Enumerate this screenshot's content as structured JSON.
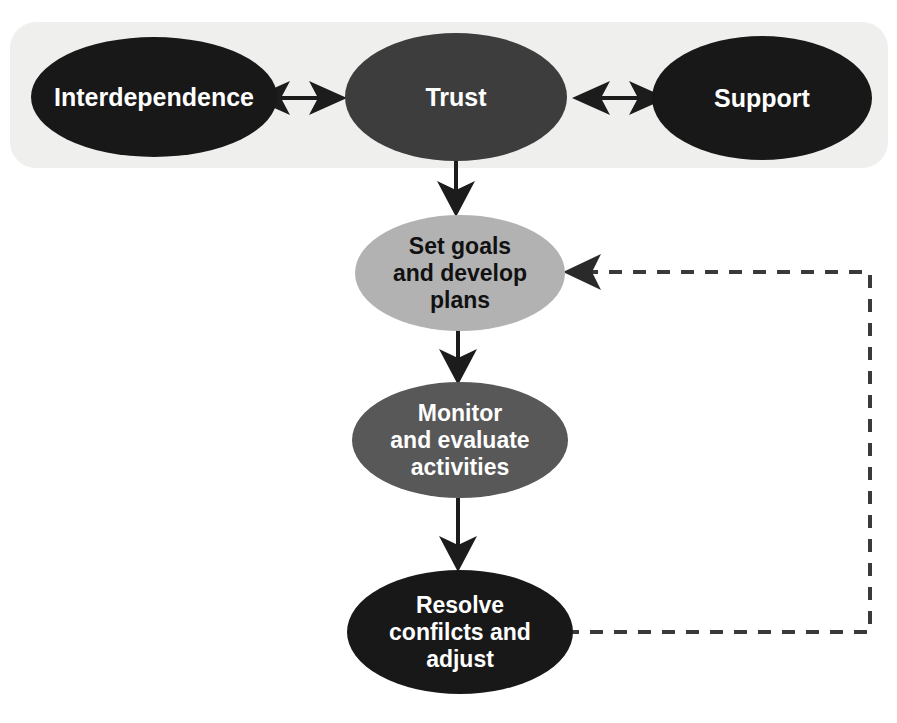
{
  "diagram": {
    "type": "flowchart",
    "title_visible": false,
    "background_color": "#ffffff",
    "panel": {
      "name": "foundation-panel",
      "fill": "#efefee",
      "x": 10,
      "y": 22,
      "width": 878,
      "height": 146,
      "radius": 26
    },
    "colors": {
      "near_black": "#181818",
      "dark_gray": "#3d3d3d",
      "medium_gray": "#585858",
      "light_gray": "#b2b2b2",
      "panel_gray": "#efefee",
      "white_text": "#ffffff",
      "black_text": "#111111",
      "stroke": "#1c1c1c"
    },
    "nodes": [
      {
        "id": "interdependence",
        "label": "Interdependence",
        "lines": [
          "Interdependence"
        ],
        "cx": 154,
        "cy": 97,
        "rx": 123,
        "ry": 60,
        "fill": "#181818",
        "text_color": "#ffffff",
        "font_size": 25,
        "row": "foundation"
      },
      {
        "id": "trust",
        "label": "Trust",
        "lines": [
          "Trust"
        ],
        "cx": 456,
        "cy": 97,
        "rx": 111,
        "ry": 64,
        "fill": "#3d3d3d",
        "text_color": "#ffffff",
        "font_size": 25,
        "row": "foundation"
      },
      {
        "id": "support",
        "label": "Support",
        "lines": [
          "Support"
        ],
        "cx": 762,
        "cy": 98,
        "rx": 110,
        "ry": 62,
        "fill": "#181818",
        "text_color": "#ffffff",
        "font_size": 25,
        "row": "foundation"
      },
      {
        "id": "set-goals",
        "label": "Set goals and develop plans",
        "lines": [
          "Set goals",
          "and develop",
          "plans"
        ],
        "cx": 460,
        "cy": 273,
        "rx": 105,
        "ry": 58,
        "fill": "#b2b2b2",
        "text_color": "#111111",
        "font_size": 23,
        "row": "process"
      },
      {
        "id": "monitor-evaluate",
        "label": "Monitor and evaluate activities",
        "lines": [
          "Monitor",
          "and evaluate",
          "activities"
        ],
        "cx": 460,
        "cy": 440,
        "rx": 108,
        "ry": 58,
        "fill": "#585858",
        "text_color": "#ffffff",
        "font_size": 23,
        "row": "process"
      },
      {
        "id": "resolve-conflicts",
        "label": "Resolve confilcts and adjust",
        "lines": [
          "Resolve",
          "confilcts and",
          "adjust"
        ],
        "cx": 460,
        "cy": 632,
        "rx": 113,
        "ry": 62,
        "fill": "#181818",
        "text_color": "#ffffff",
        "font_size": 23,
        "row": "process"
      }
    ],
    "edges": [
      {
        "id": "interdependence-trust",
        "from": "interdependence",
        "to": "trust",
        "style": "solid",
        "direction": "bidirectional",
        "orientation": "horizontal",
        "x1": 258,
        "y1": 98,
        "x2": 341,
        "y2": 98
      },
      {
        "id": "trust-support",
        "from": "trust",
        "to": "support",
        "style": "solid",
        "direction": "bidirectional",
        "orientation": "horizontal",
        "x1": 578,
        "y1": 98,
        "x2": 661,
        "y2": 98
      },
      {
        "id": "trust-set-goals",
        "from": "trust",
        "to": "set-goals",
        "style": "solid",
        "direction": "forward",
        "orientation": "vertical",
        "x1": 456,
        "y1": 160,
        "x2": 456,
        "y2": 215
      },
      {
        "id": "set-goals-monitor",
        "from": "set-goals",
        "to": "monitor-evaluate",
        "style": "solid",
        "direction": "forward",
        "orientation": "vertical",
        "x1": 458,
        "y1": 332,
        "x2": 458,
        "y2": 383
      },
      {
        "id": "monitor-resolve",
        "from": "monitor-evaluate",
        "to": "resolve-conflicts",
        "style": "solid",
        "direction": "forward",
        "orientation": "vertical",
        "x1": 458,
        "y1": 499,
        "x2": 458,
        "y2": 572
      },
      {
        "id": "resolve-set-goals-feedback",
        "from": "resolve-conflicts",
        "to": "set-goals",
        "style": "dashed",
        "direction": "forward",
        "orientation": "loop-right",
        "path": "M 566 632 L 870 632 L 870 272 L 580 272",
        "arrow_x": 566,
        "arrow_y": 272
      }
    ]
  }
}
